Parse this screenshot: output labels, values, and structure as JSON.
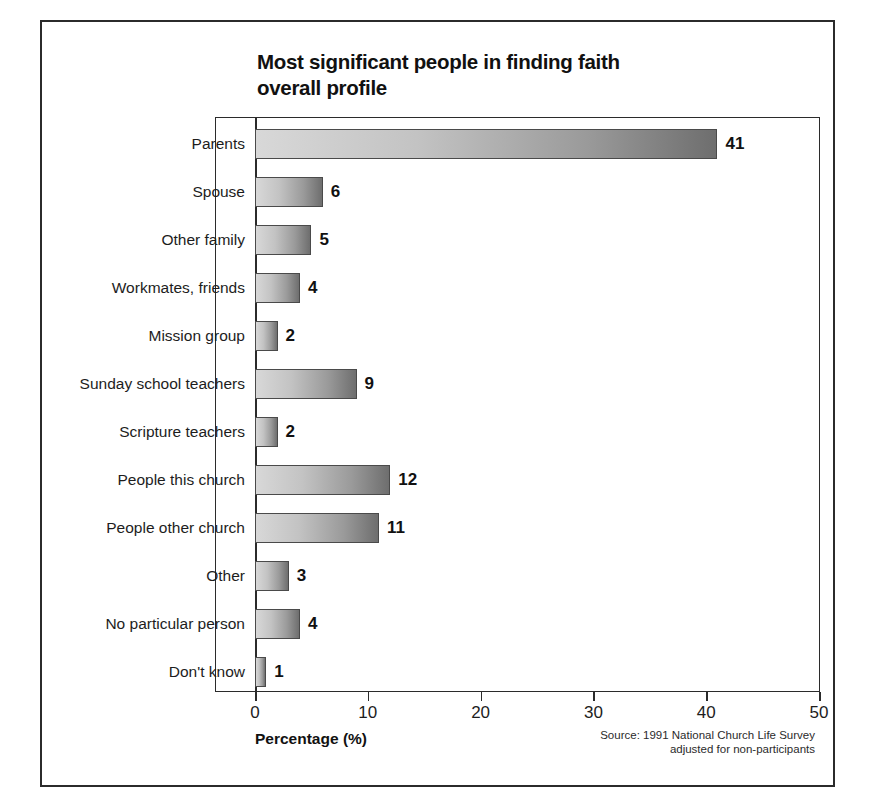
{
  "chart_data": {
    "type": "bar",
    "orientation": "horizontal",
    "title": "Most significant people in finding faith overall profile",
    "title_line1": "Most significant people in finding faith",
    "title_line2": "overall profile",
    "xlabel": "Percentage (%)",
    "ylabel": "",
    "xlim": [
      0,
      50
    ],
    "xticks": [
      0,
      10,
      20,
      30,
      40,
      50
    ],
    "xtick_labels": [
      "0",
      "10",
      "20",
      "30",
      "40",
      "50"
    ],
    "grid": false,
    "legend": false,
    "categories": [
      "Parents",
      "Spouse",
      "Other family",
      "Workmates, friends",
      "Mission group",
      "Sunday school teachers",
      "Scripture teachers",
      "People this church",
      "People other church",
      "Other",
      "No particular person",
      "Don't know"
    ],
    "values": [
      41,
      6,
      5,
      4,
      2,
      9,
      2,
      12,
      11,
      3,
      4,
      1
    ],
    "value_labels": [
      "41",
      "6",
      "5",
      "4",
      "2",
      "9",
      "2",
      "12",
      "11",
      "3",
      "4",
      "1"
    ],
    "bar_fill": "linear-gradient light-gray to dark-gray",
    "bar_edge_color": "#4a4a4a",
    "source_line1": "Source: 1991 National Church Life Survey",
    "source_line2": "adjusted for non-participants"
  },
  "frame": {
    "border_color": "#2b2b2b"
  }
}
